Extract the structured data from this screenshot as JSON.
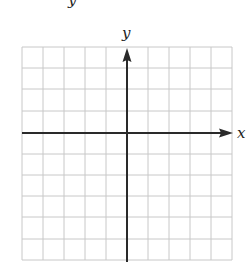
{
  "diagram": {
    "type": "coordinate-grid",
    "top_fragment_label": "y",
    "y_axis_label": "y",
    "x_axis_label": "x",
    "grid": {
      "columns": 10,
      "rows": 10,
      "origin_column": 5,
      "origin_row": 4
    },
    "colors": {
      "grid_line": "#c8c8c8",
      "axis": "#2a2a2a",
      "background": "#ffffff"
    }
  }
}
